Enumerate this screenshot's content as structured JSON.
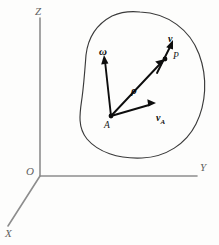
{
  "figure": {
    "background_color": "#fdfdfc",
    "axes": {
      "color": "#8d8d8d",
      "origin_label": "O",
      "z_label": "Z",
      "y_label": "Y",
      "x_label": "X"
    },
    "body": {
      "name": "rigid-body-outline",
      "stroke_color": "#3a3a3a"
    },
    "points": [
      {
        "id": "A",
        "label": "A",
        "x": 111,
        "y": 116
      },
      {
        "id": "P",
        "label": "P",
        "x": 166,
        "y": 58
      }
    ],
    "vectors": [
      {
        "id": "omega",
        "label": "ω",
        "subscript": "",
        "from": "A",
        "description": "angular velocity vector",
        "tail": [
          111,
          116
        ],
        "tip": [
          104,
          57
        ]
      },
      {
        "id": "rho",
        "label": "ρ",
        "subscript": "",
        "from": "A",
        "to": "P",
        "description": "position vector of P relative to A",
        "tail": [
          111,
          116
        ],
        "tip": [
          164,
          60
        ]
      },
      {
        "id": "v_A",
        "label": "v",
        "subscript": "A",
        "from": "A",
        "description": "velocity of point A",
        "tail": [
          111,
          116
        ],
        "tip": [
          155,
          103
        ]
      },
      {
        "id": "v",
        "label": "v",
        "subscript": "",
        "from": "P",
        "description": "velocity of point P",
        "tail": [
          158,
          72
        ],
        "tip": [
          173,
          41
        ]
      }
    ]
  }
}
